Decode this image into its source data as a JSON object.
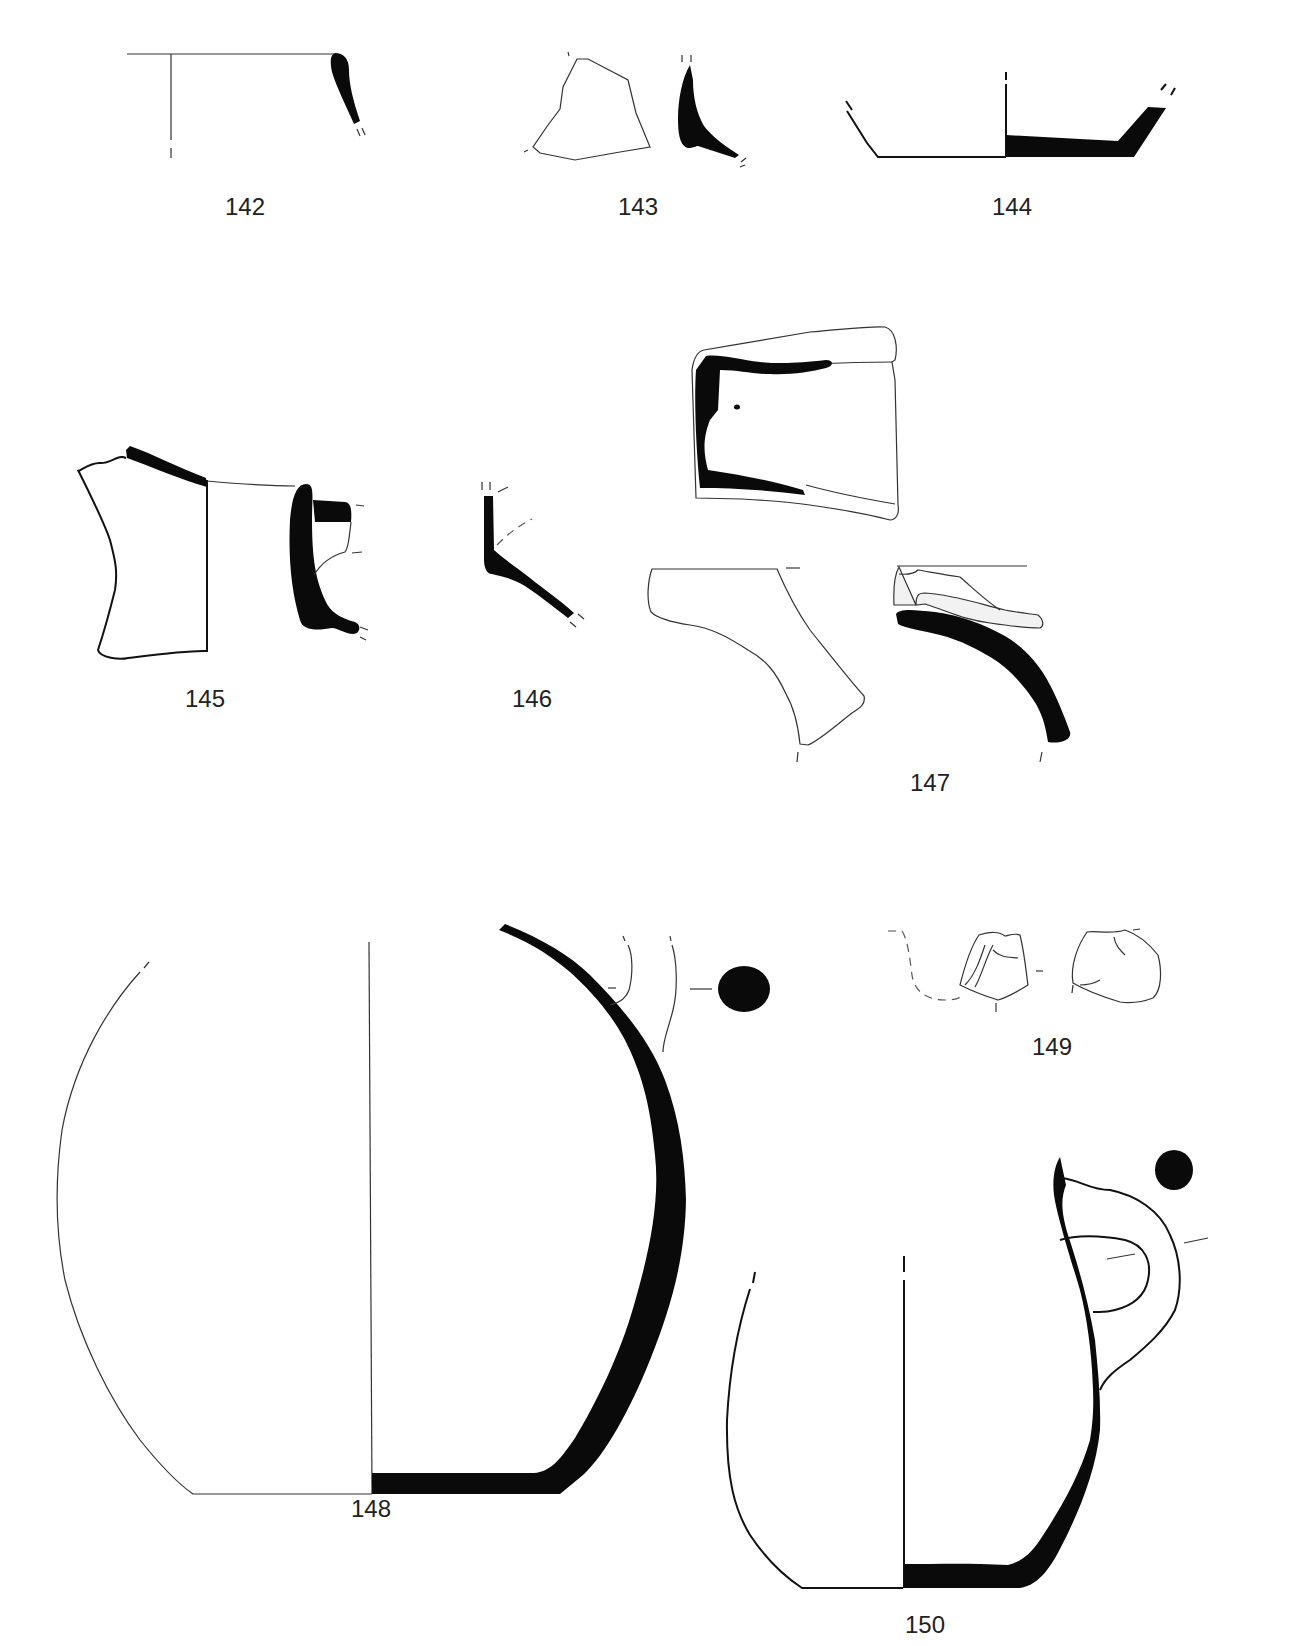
{
  "plate": {
    "background": "#ffffff",
    "ink_color": "#0a0a0a",
    "figures": [
      {
        "id": "fig-142",
        "label": "142",
        "label_pos": [
          245,
          200
        ]
      },
      {
        "id": "fig-143",
        "label": "143",
        "label_pos": [
          640,
          200
        ]
      },
      {
        "id": "fig-144",
        "label": "144",
        "label_pos": [
          1012,
          200
        ]
      },
      {
        "id": "fig-145",
        "label": "145",
        "label_pos": [
          205,
          692
        ]
      },
      {
        "id": "fig-146",
        "label": "146",
        "label_pos": [
          532,
          692
        ]
      },
      {
        "id": "fig-147",
        "label": "147",
        "label_pos": [
          930,
          776
        ]
      },
      {
        "id": "fig-148",
        "label": "148",
        "label_pos": [
          371,
          1502
        ]
      },
      {
        "id": "fig-149",
        "label": "149",
        "label_pos": [
          1052,
          1040
        ]
      },
      {
        "id": "fig-150",
        "label": "150",
        "label_pos": [
          925,
          1618
        ]
      }
    ]
  }
}
